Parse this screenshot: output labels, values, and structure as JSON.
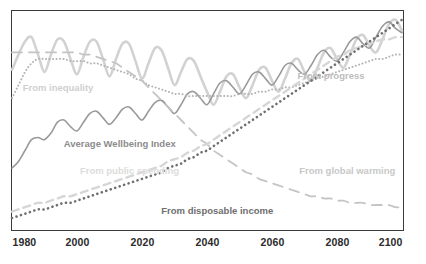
{
  "chart": {
    "type": "line",
    "frame": {
      "x": 11,
      "y": 10,
      "width": 393,
      "height": 221
    },
    "axis": {
      "x_ticks": [
        "1980",
        "2000",
        "2020",
        "2040",
        "2060",
        "2080",
        "2100"
      ],
      "x_range": [
        1980,
        2100
      ],
      "y_visible_ticks": [],
      "grid": false
    },
    "labels": {
      "inequality": "From inequality",
      "wellbeing": "Average Wellbeing Index",
      "public_spending": "From public spending",
      "disposable_income": "From disposable income",
      "progress": "From progress",
      "global_warming": "From global warming"
    },
    "colors": {
      "inequality": "#d2d2d2",
      "wellbeing": "#9a9a9a",
      "public_spending": "#d6d6d6",
      "disposable_income": "#6f6f6f",
      "progress": "#b4b4b4",
      "global_warming": "#c4c4c4",
      "frame": "#3b3b3b",
      "tick_text": "#2b2b2b",
      "background": "#ffffff"
    }
  },
  "chart_data": {
    "type": "line",
    "title": "",
    "xlabel": "",
    "ylabel": "",
    "xlim": [
      1980,
      2100
    ],
    "ylim": [
      0,
      100
    ],
    "grid": false,
    "legend": "inline-annotations",
    "x": [
      1980,
      1982,
      1984,
      1986,
      1988,
      1990,
      1992,
      1994,
      1996,
      1998,
      2000,
      2002,
      2004,
      2006,
      2008,
      2010,
      2012,
      2014,
      2016,
      2018,
      2020,
      2022,
      2024,
      2026,
      2028,
      2030,
      2032,
      2034,
      2036,
      2038,
      2040,
      2042,
      2044,
      2046,
      2048,
      2050,
      2052,
      2054,
      2056,
      2058,
      2060,
      2062,
      2064,
      2066,
      2068,
      2070,
      2072,
      2074,
      2076,
      2078,
      2080,
      2082,
      2084,
      2086,
      2088,
      2090,
      2092,
      2094,
      2096,
      2098,
      2100
    ],
    "series": [
      {
        "name": "From inequality",
        "style": "solid",
        "color": "#d2d2d2",
        "width": 2.6,
        "values": [
          73,
          80,
          86,
          88,
          80,
          72,
          80,
          87,
          86,
          78,
          71,
          79,
          86,
          86,
          78,
          70,
          78,
          85,
          85,
          77,
          69,
          76,
          83,
          82,
          74,
          66,
          72,
          78,
          77,
          70,
          63,
          57,
          63,
          70,
          71,
          65,
          60,
          66,
          73,
          74,
          68,
          63,
          69,
          76,
          78,
          72,
          68,
          74,
          81,
          83,
          78,
          74,
          80,
          87,
          89,
          84,
          81,
          87,
          94,
          96,
          91
        ]
      },
      {
        "name": "Average Wellbeing Index",
        "style": "solid",
        "color": "#9a9a9a",
        "width": 1.6,
        "values": [
          28,
          31,
          36,
          41,
          42,
          41,
          44,
          49,
          50,
          47,
          45,
          49,
          53,
          54,
          51,
          48,
          51,
          55,
          56,
          53,
          50,
          54,
          58,
          59,
          56,
          53,
          57,
          62,
          63,
          60,
          57,
          62,
          67,
          68,
          65,
          62,
          66,
          71,
          72,
          69,
          66,
          70,
          75,
          76,
          73,
          71,
          75,
          80,
          82,
          79,
          77,
          81,
          86,
          88,
          85,
          83,
          88,
          93,
          95,
          92,
          90
        ]
      },
      {
        "name": "From progress",
        "style": "dotted",
        "color": "#b4b4b4",
        "width": 2.0,
        "values": [
          60,
          66,
          72,
          76,
          78,
          78,
          78,
          78,
          78,
          77,
          77,
          77,
          76,
          76,
          75,
          74,
          73,
          72,
          71,
          69,
          68,
          66,
          65,
          64,
          63,
          62,
          62,
          61,
          61,
          61,
          61,
          61,
          61,
          61,
          61,
          62,
          62,
          62,
          63,
          63,
          64,
          64,
          65,
          65,
          66,
          67,
          68,
          69,
          70,
          71,
          72,
          73,
          74,
          75,
          76,
          77,
          78,
          78,
          79,
          80,
          80
        ]
      },
      {
        "name": "From global warming",
        "style": "long-dashed",
        "color": "#c4c4c4",
        "width": 1.8,
        "values": [
          81,
          81,
          81,
          81,
          81,
          81,
          81,
          81,
          81,
          81,
          81,
          80,
          80,
          79,
          78,
          77,
          76,
          74,
          72,
          70,
          68,
          65,
          62,
          59,
          56,
          53,
          50,
          47,
          44,
          41,
          39,
          36,
          34,
          32,
          30,
          28,
          26,
          25,
          23,
          22,
          21,
          20,
          19,
          18,
          17,
          16,
          15,
          15,
          14,
          14,
          13,
          13,
          12,
          12,
          12,
          11,
          11,
          11,
          11,
          10,
          10
        ]
      },
      {
        "name": "From public spending",
        "style": "dashed",
        "color": "#d6d6d6",
        "width": 2.4,
        "values": [
          8,
          9,
          10,
          11,
          12,
          12,
          13,
          14,
          15,
          15,
          16,
          17,
          18,
          19,
          20,
          21,
          22,
          23,
          24,
          25,
          26,
          27,
          28,
          29,
          31,
          32,
          33,
          35,
          36,
          38,
          39,
          41,
          43,
          45,
          47,
          49,
          51,
          53,
          55,
          57,
          59,
          61,
          63,
          65,
          67,
          69,
          71,
          73,
          75,
          77,
          79,
          80,
          82,
          83,
          84,
          85,
          86,
          87,
          87,
          88,
          88
        ]
      },
      {
        "name": "From disposable income",
        "style": "dotted-thick",
        "color": "#6f6f6f",
        "width": 2.6,
        "values": [
          5,
          6,
          7,
          8,
          9,
          9,
          10,
          11,
          12,
          12,
          13,
          14,
          15,
          16,
          17,
          18,
          19,
          20,
          21,
          22,
          23,
          24,
          25,
          26,
          28,
          29,
          30,
          32,
          33,
          35,
          36,
          38,
          40,
          42,
          44,
          46,
          48,
          50,
          52,
          54,
          56,
          58,
          60,
          62,
          64,
          66,
          68,
          70,
          72,
          74,
          76,
          78,
          80,
          82,
          84,
          86,
          88,
          90,
          92,
          94,
          96
        ]
      }
    ],
    "annotations": [
      {
        "text": "From inequality",
        "x": 1994,
        "y_px": 82,
        "color": "#d0d0d0"
      },
      {
        "text": "From progress",
        "x": 2078,
        "y_px": 70,
        "color": "#bdbdbd"
      },
      {
        "text": "Average Wellbeing Index",
        "x": 2013,
        "y_px": 138,
        "color": "#8c8c8c"
      },
      {
        "text": "From public spending",
        "x": 2016,
        "y_px": 165,
        "color": "#dcdcdc"
      },
      {
        "text": "From global warming",
        "x": 2083,
        "y_px": 165,
        "color": "#c8c8c8"
      },
      {
        "text": "From disposable income",
        "x": 2043,
        "y_px": 205,
        "color": "#6e6e6e"
      }
    ]
  }
}
